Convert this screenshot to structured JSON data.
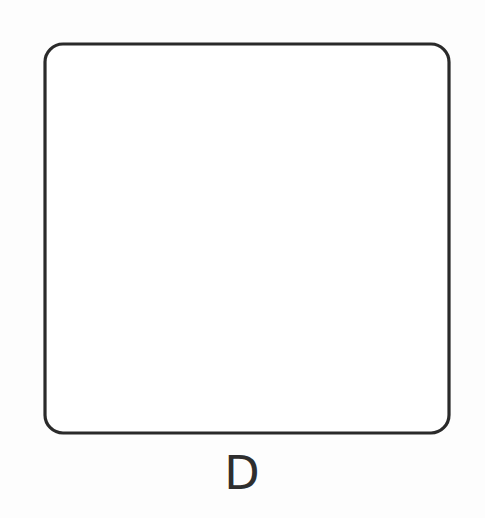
{
  "figure": {
    "label": "D",
    "caption_label": "D",
    "icon_names": [
      "knit-stitch-icon",
      "crease-shading-icon",
      "hatch-line-icon"
    ]
  },
  "swatch": {
    "bounds": {
      "left": 45,
      "top": 44,
      "right": 449,
      "bottom": 433
    },
    "corner_radius": 18,
    "outline_color": "#2b2b2b",
    "outline_width": 3.2,
    "fill_color": "#ffffff",
    "stitch_color": "#333333",
    "stitch_line_width": 2.6,
    "dash_color": "#3a3a3a",
    "dash_line_width": 1.7,
    "stitch_angle_degrees": 45,
    "row_count": 22,
    "stitches_per_row": 24
  },
  "crease": {
    "name": "diagonal-crease-band",
    "shade_color": "#cfcfcf",
    "shade_color_light": "#e4e4e4",
    "shade_color_dark": "#b9b9b9",
    "hatch_color": "#1f1f1f",
    "hatch_line_width": 1.9,
    "edge_color": "#222222",
    "edge_width": 3.4,
    "start_point": {
      "x": 438,
      "y": 62
    },
    "end_point": {
      "x": 62,
      "y": 424
    },
    "band_half_width": 30,
    "direction": "top-right-to-bottom-left",
    "hatch_count": 54
  },
  "colors": {
    "background": "#fdfdfd",
    "ink": "#2b2b2b",
    "shade": "#cfcfcf",
    "caption": "#2e2e2e"
  }
}
